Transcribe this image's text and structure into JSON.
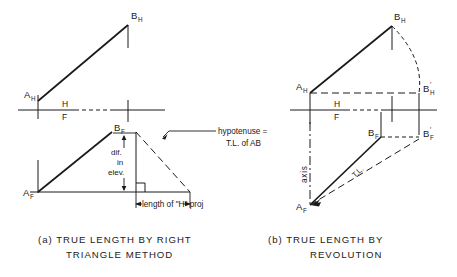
{
  "figure": {
    "panels": [
      {
        "id": "a",
        "caption_line1": "(a)  TRUE  LENGTH  BY  RIGHT",
        "caption_line2": "TRIANGLE  METHOD",
        "labels": {
          "a_h": "A",
          "a_h_sub": "H",
          "b_h": "B",
          "b_h_sub": "H",
          "a_f": "A",
          "a_f_sub": "F",
          "b_f": "B",
          "b_f_sub": "F",
          "fold_h": "H",
          "fold_f": "F",
          "dim_dif": "dif.",
          "dim_in": "in",
          "dim_elev": "elev.",
          "note_line1": "hypotenuse =",
          "note_line2": "T.L. of  AB",
          "dim_hproj": "length of \"H\" proj"
        }
      },
      {
        "id": "b",
        "caption_line1": "(b)  TRUE  LENGTH  BY",
        "caption_line2": "REVOLUTION",
        "labels": {
          "a_h": "A",
          "a_h_sub": "H",
          "b_h": "B",
          "b_h_sub": "H",
          "b_h_prime": "B",
          "b_h_prime_sub": "H",
          "b_h_prime_mark": "′",
          "a_f": "A",
          "a_f_sub": "F",
          "b_f": "B",
          "b_f_sub": "F",
          "b_f_prime": "B",
          "b_f_prime_sub": "F",
          "b_f_prime_mark": "′",
          "fold_h": "H",
          "fold_f": "F",
          "axis": "axis",
          "tl": "T.L."
        }
      }
    ],
    "colors": {
      "ink": "#1a1a1a",
      "paper": "#ffffff"
    }
  }
}
